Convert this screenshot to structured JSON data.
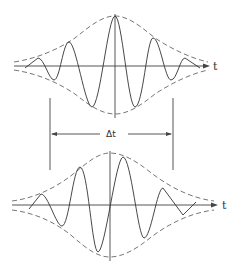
{
  "diagram": {
    "title": "",
    "top_wave": {
      "axis_label": "t",
      "description": "Wave packet with symmetric envelope; carrier peak aligned with envelope peak"
    },
    "interval": {
      "label": "Δt"
    },
    "bottom_wave": {
      "axis_label": "t",
      "description": "Wave packet with same envelope; carrier phase shifted relative to envelope"
    },
    "colors": {
      "line": "#333333",
      "envelope": "#666666",
      "background": "#ffffff"
    }
  }
}
